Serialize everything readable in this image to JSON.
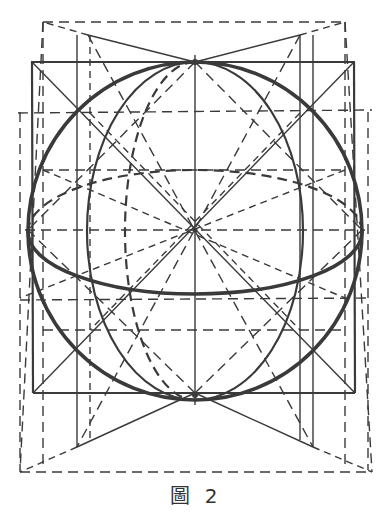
{
  "figure": {
    "caption": "圖 2",
    "stroke_color": "#3a3a3a",
    "background": "#ffffff",
    "center": [
      195,
      230
    ]
  }
}
